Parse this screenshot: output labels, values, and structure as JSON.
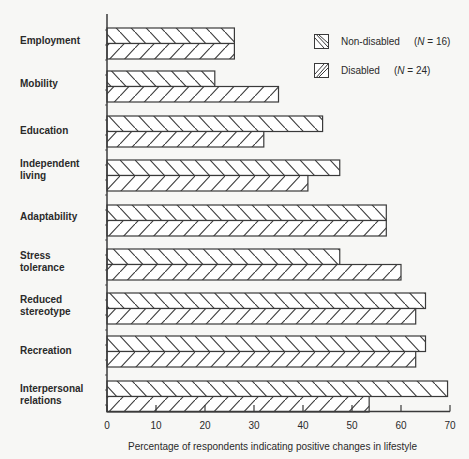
{
  "chart_data": {
    "type": "bar",
    "orientation": "horizontal",
    "title": "",
    "xlabel": "Percentage of respondents indicating positive changes in lifestyle",
    "ylabel": "",
    "xlim": [
      0,
      70
    ],
    "xticks": [
      0,
      10,
      20,
      30,
      40,
      50,
      60,
      70
    ],
    "grid": false,
    "legend_position": "top-right",
    "categories": [
      "Employment",
      "Mobility",
      "Education",
      "Independent living",
      "Adaptability",
      "Stress tolerance",
      "Reduced stereotype",
      "Recreation",
      "Interpersonal relations"
    ],
    "category_label_lines": [
      [
        "Employment"
      ],
      [
        "Mobility"
      ],
      [
        "Education"
      ],
      [
        "Independent",
        "living"
      ],
      [
        "Adaptability"
      ],
      [
        "Stress",
        "tolerance"
      ],
      [
        "Reduced",
        "stereotype"
      ],
      [
        "Recreation"
      ],
      [
        "Interpersonal",
        "relations"
      ]
    ],
    "series": [
      {
        "name": "Non-disabled",
        "n_label": "N",
        "n_value": "= 16",
        "pattern": "backslash-hatch",
        "values": [
          26,
          22,
          44,
          47.5,
          57,
          47.5,
          65,
          65,
          69.5
        ]
      },
      {
        "name": "Disabled",
        "n_label": "N",
        "n_value": "= 24",
        "pattern": "slash-hatch",
        "values": [
          26,
          35,
          32,
          41,
          57,
          60,
          63,
          63,
          53.5
        ]
      }
    ]
  },
  "legend": {
    "items": [
      {
        "label": "Non-disabled",
        "n_var": "N",
        "n_rest": " = 16)",
        "n_open": "("
      },
      {
        "label": "Disabled",
        "n_var": "N",
        "n_rest": " = 24)",
        "n_open": "("
      }
    ]
  },
  "colors": {
    "ink": "#3a3a3a",
    "background": "#f7f7f5",
    "bar_fill": "#ffffff"
  }
}
